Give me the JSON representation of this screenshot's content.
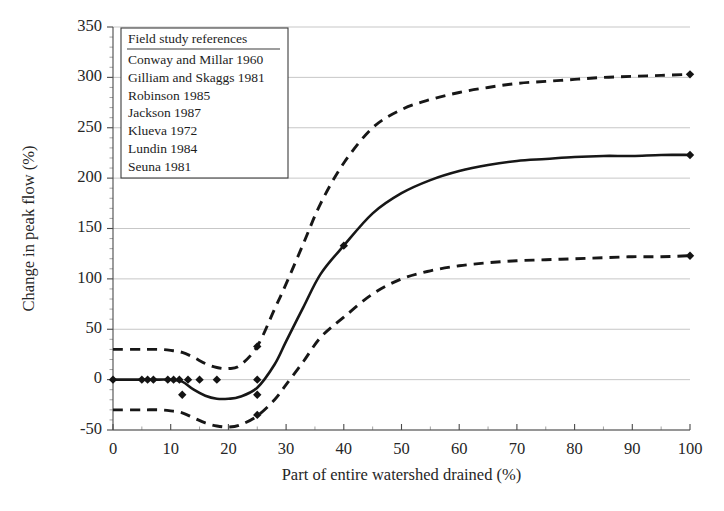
{
  "chart_data": {
    "type": "line",
    "title": "",
    "xlabel": "Part of entire watershed drained (%)",
    "ylabel": "Change in peak flow (%)",
    "xlim": [
      0,
      100
    ],
    "ylim": [
      -50,
      350
    ],
    "xticks": [
      0,
      10,
      20,
      30,
      40,
      50,
      60,
      70,
      80,
      90,
      100
    ],
    "yticks": [
      -50,
      0,
      50,
      100,
      150,
      200,
      250,
      300,
      350
    ],
    "xtick_labels": [
      "0",
      "10",
      "20",
      "30",
      "40",
      "50",
      "60",
      "70",
      "80",
      "90",
      "100"
    ],
    "ytick_labels": [
      "-50",
      "0",
      "50",
      "100",
      "150",
      "200",
      "250",
      "300",
      "350"
    ],
    "grid": "horizontal",
    "minor_ticks": true,
    "legend_position": "upper-left",
    "series": [
      {
        "name": "upper-envelope",
        "style": "dashed",
        "x": [
          0,
          5,
          8,
          10,
          12,
          14,
          16,
          18,
          20,
          22,
          25,
          28,
          30,
          33,
          36,
          40,
          45,
          50,
          55,
          60,
          65,
          70,
          75,
          80,
          85,
          90,
          95,
          100
        ],
        "values": [
          30,
          30,
          30,
          29,
          27,
          22,
          16,
          12,
          11,
          14,
          33,
          70,
          95,
          135,
          175,
          215,
          250,
          268,
          278,
          285,
          290,
          294,
          296,
          298,
          300,
          301,
          302,
          303
        ]
      },
      {
        "name": "mean-trend",
        "style": "solid",
        "x": [
          0,
          5,
          8,
          10,
          12,
          14,
          16,
          18,
          20,
          22,
          25,
          28,
          30,
          33,
          36,
          40,
          45,
          50,
          55,
          60,
          65,
          70,
          75,
          80,
          85,
          90,
          95,
          100
        ],
        "values": [
          0,
          0,
          0,
          0,
          -2,
          -10,
          -16,
          -19,
          -19,
          -17,
          -8,
          15,
          38,
          72,
          105,
          133,
          165,
          185,
          198,
          207,
          213,
          217,
          219,
          221,
          222,
          222,
          223,
          223
        ]
      },
      {
        "name": "lower-envelope",
        "style": "dashed",
        "x": [
          0,
          5,
          8,
          10,
          12,
          14,
          16,
          18,
          20,
          22,
          25,
          28,
          30,
          33,
          36,
          40,
          45,
          50,
          55,
          60,
          65,
          70,
          75,
          80,
          85,
          90,
          95,
          100
        ],
        "values": [
          -30,
          -30,
          -30,
          -31,
          -33,
          -38,
          -43,
          -46,
          -47,
          -45,
          -36,
          -20,
          -5,
          18,
          42,
          62,
          85,
          100,
          108,
          113,
          116,
          118,
          119,
          120,
          121,
          122,
          122,
          123
        ]
      }
    ],
    "points": [
      {
        "x": 0,
        "y": 0
      },
      {
        "x": 5,
        "y": 0
      },
      {
        "x": 6,
        "y": 0
      },
      {
        "x": 7,
        "y": 0
      },
      {
        "x": 9.5,
        "y": 0
      },
      {
        "x": 10.5,
        "y": 0
      },
      {
        "x": 11.5,
        "y": 0
      },
      {
        "x": 12,
        "y": -15
      },
      {
        "x": 13,
        "y": 0
      },
      {
        "x": 15,
        "y": 0
      },
      {
        "x": 18,
        "y": 0
      },
      {
        "x": 25,
        "y": 33
      },
      {
        "x": 25,
        "y": 0
      },
      {
        "x": 25,
        "y": -15
      },
      {
        "x": 25,
        "y": -35
      },
      {
        "x": 40,
        "y": 133
      },
      {
        "x": 100,
        "y": 303
      },
      {
        "x": 100,
        "y": 223
      },
      {
        "x": 100,
        "y": 123
      }
    ]
  },
  "legend": {
    "title": "Field study references",
    "entries": [
      "Conway and Millar 1960",
      "Gilliam and Skaggs 1981",
      "Robinson 1985",
      "Jackson 1987",
      "Klueva 1972",
      "Lundin 1984",
      "Seuna 1981"
    ]
  },
  "colors": {
    "curve": "#171717",
    "grid": "#b9b9b9",
    "axis": "#4a4a4a",
    "text": "#262626",
    "background": "#ffffff"
  }
}
